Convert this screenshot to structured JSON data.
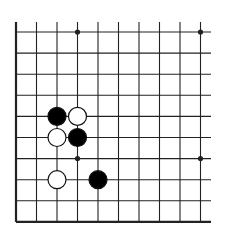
{
  "diagram": {
    "type": "go-board-fragment",
    "background": "#ffffff",
    "line_color": "#222222",
    "grid": {
      "origin_x": 16,
      "origin_y": 32,
      "spacing_x": 20.5,
      "spacing_y": 21.1,
      "columns": 10,
      "rows": 10,
      "top_extend_to": 22,
      "right_extend_to": 211,
      "left_edge": true,
      "bottom_edge": true
    },
    "star_points": [
      {
        "col": 3,
        "row": 0
      },
      {
        "col": 9,
        "row": 0
      },
      {
        "col": 3,
        "row": 6
      },
      {
        "col": 9,
        "row": 6
      }
    ],
    "stones": [
      {
        "color": "black",
        "col": 2,
        "row": 4
      },
      {
        "color": "white",
        "col": 3,
        "row": 4
      },
      {
        "color": "white",
        "col": 2,
        "row": 5
      },
      {
        "color": "black",
        "col": 3,
        "row": 5
      },
      {
        "color": "white",
        "col": 2,
        "row": 7
      },
      {
        "color": "black",
        "col": 4,
        "row": 7
      }
    ],
    "stone_radius": 9,
    "colors": {
      "black_stone": "#000000",
      "white_stone": "#ffffff",
      "stone_outline": "#111111"
    }
  }
}
